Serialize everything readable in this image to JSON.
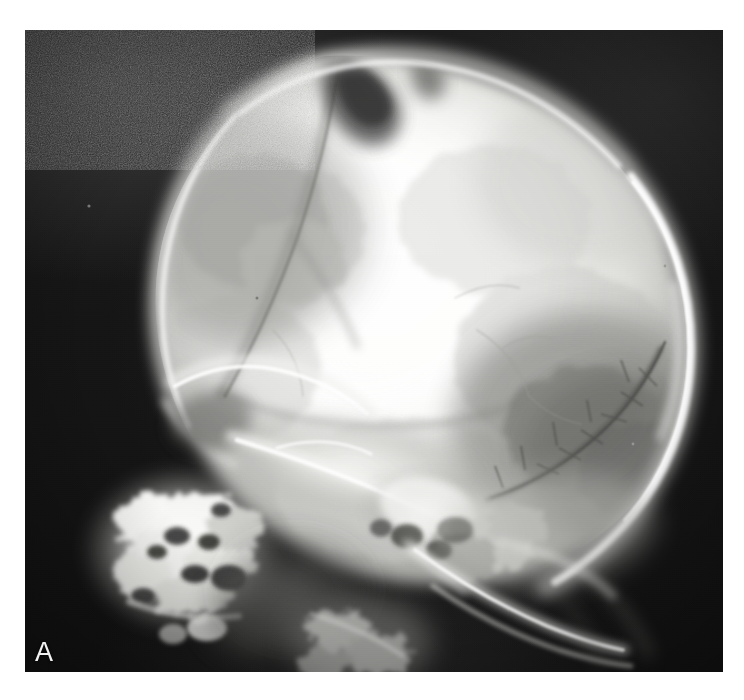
{
  "page": {
    "background_color": "#ffffff",
    "width": 744,
    "height": 700
  },
  "figure": {
    "type": "radiograph",
    "modality": "plain film x-ray",
    "projection": "lateral skull",
    "panel_label": "A",
    "film": {
      "left": 25,
      "top": 30,
      "width": 698,
      "height": 642,
      "background_color": "#171717",
      "border_color": "#000000"
    },
    "colors": {
      "film_black": "#171717",
      "bone_bright": "#f7f7f5",
      "bone_mid": "#c9c9c6",
      "bone_dim": "#8e8e8b",
      "soft_tissue": "#4a4a48",
      "label_white": "#f2f2f2"
    },
    "anatomy": [
      {
        "name": "calvarium",
        "label": "skull vault",
        "density": "bright"
      },
      {
        "name": "frontal-bone",
        "label": "frontal bone",
        "density": "mid"
      },
      {
        "name": "coronal-suture",
        "label": "coronal suture",
        "density": "lucent"
      },
      {
        "name": "vertex-lucency",
        "label": "vertex lucent defect",
        "density": "lucent"
      },
      {
        "name": "lambdoid-suture",
        "label": "lambdoid suture with wormian bones",
        "density": "lucent"
      },
      {
        "name": "occipital-rim",
        "label": "posterior calvarial rim",
        "density": "bright"
      },
      {
        "name": "orbital-roof",
        "label": "orbital roof",
        "density": "bright"
      },
      {
        "name": "sella-skull-base",
        "label": "skull base",
        "density": "bright"
      },
      {
        "name": "facial-bones",
        "label": "facial bones and maxilla",
        "density": "bright"
      },
      {
        "name": "petrous-temporal",
        "label": "petrous temporal bone",
        "density": "bright"
      },
      {
        "name": "mandible",
        "label": "mandibular ramus",
        "density": "bright"
      },
      {
        "name": "cervical-spine",
        "label": "upper cervical spine",
        "density": "mid"
      }
    ]
  }
}
